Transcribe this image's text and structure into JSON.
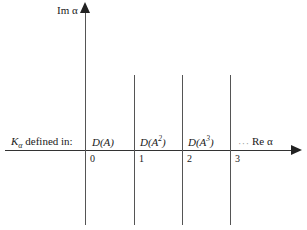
{
  "figure": {
    "axes": {
      "vertical_label": "Im α",
      "horizontal_label": "Re α",
      "ellipsis": "···"
    },
    "row_label": {
      "symbol": "K",
      "subscript": "α",
      "text": " defined in:"
    },
    "domains": [
      {
        "base": "D(A",
        "exponent": "",
        "close": ")"
      },
      {
        "base": "D(A",
        "exponent": "2",
        "close": ")"
      },
      {
        "base": "D(A",
        "exponent": "3",
        "close": ")"
      }
    ],
    "ticks": [
      "0",
      "1",
      "2",
      "3"
    ],
    "colors": {
      "axis": "#333333",
      "line": "#555555",
      "text": "#1a1a1a",
      "background": "#ffffff"
    }
  },
  "chart_data": {
    "type": "line",
    "title": "",
    "xlabel": "Re α",
    "ylabel": "Im α",
    "xlim": [
      -1.7,
      4.3
    ],
    "ylim": [
      -1.6,
      2.9
    ],
    "grid": false,
    "legend": null,
    "annotations": [
      "K_α defined in:",
      "D(A)",
      "D(A²)",
      "D(A³)"
    ],
    "xticks": [
      0,
      1,
      2,
      3
    ],
    "xticklabels": [
      "0",
      "1",
      "2",
      "3"
    ],
    "yticks": [],
    "yticklabels": [],
    "series": [
      {
        "name": "Re α = 0 boundary",
        "x": [
          0,
          0
        ],
        "y": [
          -1.55,
          2.85
        ]
      },
      {
        "name": "Re α = 1 boundary",
        "x": [
          1,
          1
        ],
        "y": [
          -1.55,
          1.55
        ]
      },
      {
        "name": "Re α = 2 boundary",
        "x": [
          2,
          2
        ],
        "y": [
          -1.55,
          1.55
        ]
      },
      {
        "name": "Re α = 3 boundary",
        "x": [
          3,
          3
        ],
        "y": [
          -1.55,
          1.55
        ]
      }
    ],
    "region_labels": [
      {
        "label": "D(A)",
        "x_range": [
          0,
          1
        ]
      },
      {
        "label": "D(A²)",
        "x_range": [
          1,
          2
        ]
      },
      {
        "label": "D(A³)",
        "x_range": [
          2,
          3
        ]
      }
    ]
  }
}
